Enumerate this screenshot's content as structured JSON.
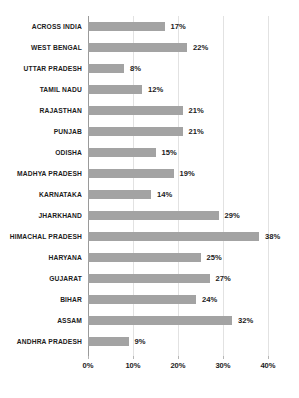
{
  "chart_data": {
    "type": "bar",
    "orientation": "horizontal",
    "title": "",
    "xlabel": "",
    "ylabel": "",
    "xlim": [
      0,
      40
    ],
    "xticks": [
      "0%",
      "10%",
      "20%",
      "30%",
      "40%"
    ],
    "xtick_values": [
      0,
      10,
      20,
      30,
      40
    ],
    "grid": true,
    "legend": null,
    "value_suffix": "%",
    "bar_color": "#a3a3a3",
    "gridline_color": "#e2e2e2",
    "axis_color": "#9a9a9a",
    "categories": [
      "ACROSS INDIA",
      "WEST BENGAL",
      "UTTAR PRADESH",
      "TAMIL NADU",
      "RAJASTHAN",
      "PUNJAB",
      "ODISHA",
      "MADHYA PRADESH",
      "KARNATAKA",
      "JHARKHAND",
      "HIMACHAL PRADESH",
      "HARYANA",
      "GUJARAT",
      "BIHAR",
      "ASSAM",
      "ANDHRA PRADESH"
    ],
    "values": [
      17,
      22,
      8,
      12,
      21,
      21,
      15,
      19,
      14,
      29,
      38,
      25,
      27,
      24,
      32,
      9
    ],
    "value_labels": [
      "17%",
      "22%",
      "8%",
      "12%",
      "21%",
      "21%",
      "15%",
      "19%",
      "14%",
      "29%",
      "38%",
      "25%",
      "27%",
      "24%",
      "32%",
      "9%"
    ]
  }
}
